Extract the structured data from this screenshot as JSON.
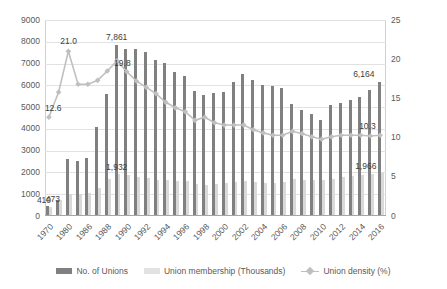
{
  "chart_data": {
    "type": "bar",
    "title": "",
    "xlabel": "",
    "ylabel": "",
    "ylim": [
      0,
      9000
    ],
    "y2lim": [
      0,
      25
    ],
    "grid": true,
    "legend_position": "bottom",
    "x_tick_labels": [
      "1970",
      "1980",
      "1986",
      "1988",
      "1990",
      "1992",
      "1994",
      "1996",
      "1998",
      "2000",
      "2002",
      "2004",
      "2006",
      "2008",
      "2010",
      "2012",
      "2014",
      "2016"
    ],
    "y_tick_labels": [
      "0",
      "1000",
      "2000",
      "3000",
      "4000",
      "5000",
      "6000",
      "7000",
      "8000",
      "9000"
    ],
    "y2_tick_labels": [
      "0",
      "5",
      "10",
      "15",
      "20",
      "25"
    ],
    "categories": [
      "1970",
      "1975",
      "1980",
      "1983",
      "1986",
      "1987",
      "1988",
      "1989",
      "1990",
      "1991",
      "1992",
      "1993",
      "1994",
      "1995",
      "1996",
      "1997",
      "1998",
      "1999",
      "2000",
      "2001",
      "2002",
      "2003",
      "2004",
      "2005",
      "2006",
      "2007",
      "2008",
      "2009",
      "2010",
      "2011",
      "2012",
      "2013",
      "2014",
      "2015",
      "2016"
    ],
    "series": [
      {
        "name": "No. of Unions",
        "axis": "left",
        "color": "#808080",
        "values": [
          473,
          750,
          2618,
          2534,
          2675,
          4103,
          5598,
          7861,
          7676,
          7656,
          7527,
          7147,
          7025,
          6606,
          6424,
          5733,
          5560,
          5637,
          5698,
          6150,
          6506,
          6257,
          6017,
          5971,
          5889,
          5125,
          4886,
          4689,
          4420,
          5120,
          5177,
          5305,
          5445,
          5794,
          6164
        ]
      },
      {
        "name": "Union membership (Thousands)",
        "axis": "left",
        "color": "#d9d9d9",
        "values": [
          410,
          750,
          1006,
          1009,
          1036,
          1267,
          1707,
          1932,
          1887,
          1803,
          1735,
          1667,
          1659,
          1615,
          1599,
          1484,
          1402,
          1481,
          1527,
          1569,
          1606,
          1550,
          1537,
          1506,
          1559,
          1688,
          1666,
          1640,
          1643,
          1720,
          1781,
          1848,
          1905,
          1939,
          1966
        ]
      },
      {
        "name": "Union density (%)",
        "axis": "right",
        "color": "#bfbfbf",
        "values": [
          12.6,
          15.8,
          21.0,
          16.8,
          16.8,
          17.3,
          18.5,
          19.8,
          18.4,
          17.2,
          16.4,
          15.6,
          14.5,
          13.8,
          13.3,
          12.2,
          12.6,
          11.9,
          11.6,
          11.6,
          11.6,
          11.0,
          10.6,
          10.3,
          10.3,
          10.8,
          10.5,
          10.1,
          9.8,
          10.1,
          10.3,
          10.3,
          10.3,
          10.2,
          10.3
        ]
      }
    ],
    "data_labels": [
      {
        "id": "unions-1970",
        "text": "473",
        "series": "No. of Unions"
      },
      {
        "id": "members-1970",
        "text": "410",
        "series": "Union membership (Thousands)"
      },
      {
        "id": "density-1970",
        "text": "12.6",
        "series": "Union density (%)"
      },
      {
        "id": "density-1980",
        "text": "21.0",
        "series": "Union density (%)"
      },
      {
        "id": "unions-1989",
        "text": "7,861",
        "series": "No. of Unions"
      },
      {
        "id": "density-1989",
        "text": "19.8",
        "series": "Union density (%)"
      },
      {
        "id": "members-1989",
        "text": "1,932",
        "series": "Union membership (Thousands)"
      },
      {
        "id": "unions-2016",
        "text": "6,164",
        "series": "No. of Unions"
      },
      {
        "id": "density-2016",
        "text": "10.3",
        "series": "Union density (%)"
      },
      {
        "id": "members-2016",
        "text": "1,966",
        "series": "Union membership (Thousands)"
      }
    ]
  },
  "legend": {
    "items": [
      {
        "label": "No. of Unions",
        "marker": "bar-dark-icon"
      },
      {
        "label": "Union membership (Thousands)",
        "marker": "bar-light-icon"
      },
      {
        "label": "Union density (%)",
        "marker": "line-marker-icon"
      }
    ]
  }
}
